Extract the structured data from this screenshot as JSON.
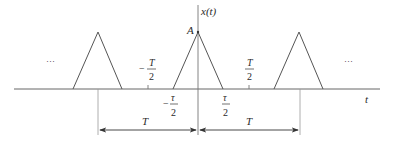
{
  "diagram": {
    "type": "periodic triangular pulse train",
    "axis_labels": {
      "vertical": "x(t)",
      "horizontal": "t"
    },
    "amplitude_label": "A",
    "ellipsis_left": "···",
    "ellipsis_right": "···",
    "tick_labels": {
      "neg_half_period": {
        "sign": "−",
        "numerator": "T",
        "denominator": "2"
      },
      "pos_half_period": {
        "numerator": "T",
        "denominator": "2"
      },
      "neg_half_width": {
        "sign": "−",
        "numerator": "τ",
        "denominator": "2"
      },
      "pos_half_width": {
        "numerator": "τ",
        "denominator": "2"
      }
    },
    "period_dimensions": [
      {
        "label": "T"
      },
      {
        "label": "T"
      }
    ],
    "colors": {
      "line": "#555555",
      "text": "#2a2a2a",
      "guide": "#9a9a9a"
    }
  }
}
